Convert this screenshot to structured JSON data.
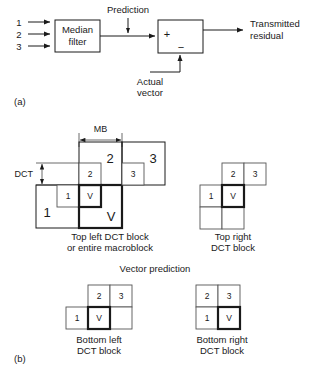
{
  "figure": {
    "part_a": {
      "part_label": "(a)",
      "inputs": [
        "1",
        "2",
        "3"
      ],
      "median_filter_label_line1": "Median",
      "median_filter_label_line2": "filter",
      "prediction_label": "Prediction",
      "adder_plus": "+",
      "adder_minus": "−",
      "actual_vector_line1": "Actual",
      "actual_vector_line2": "vector",
      "output_line1": "Transmitted",
      "output_line2": "residual"
    },
    "part_b": {
      "part_label": "(b)",
      "dim_mb": "MB",
      "dim_dct": "DCT",
      "center_title": "Vector prediction",
      "diagrams": [
        {
          "name": "top-left",
          "caption_line1": "Top left DCT block",
          "caption_line2": "or entire macroblock",
          "macro_cells": [
            {
              "label": "1",
              "size": "large"
            },
            {
              "label": "2",
              "size": "large"
            },
            {
              "label": "3",
              "size": "large"
            },
            {
              "label": "V",
              "size": "large"
            }
          ],
          "dct_cells": [
            {
              "label": "1",
              "size": "small"
            },
            {
              "label": "2",
              "size": "small"
            },
            {
              "label": "3",
              "size": "small"
            },
            {
              "label": "V",
              "size": "small"
            }
          ],
          "current_block": "V"
        },
        {
          "name": "top-right",
          "caption_line1": "Top right",
          "caption_line2": "DCT block",
          "cells": [
            "2",
            "3",
            "1",
            "V"
          ],
          "current_block": "V"
        },
        {
          "name": "bottom-left",
          "caption_line1": "Bottom left",
          "caption_line2": "DCT block",
          "cells": [
            "2",
            "3",
            "1",
            "V"
          ],
          "current_block": "V"
        },
        {
          "name": "bottom-right",
          "caption_line1": "Bottom right",
          "caption_line2": "DCT block",
          "cells": [
            "2",
            "3",
            "1",
            "V"
          ],
          "current_block": "V"
        }
      ]
    }
  }
}
